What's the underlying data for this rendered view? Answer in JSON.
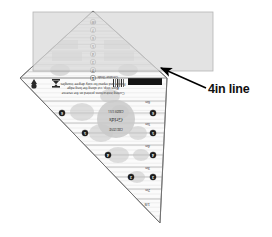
{
  "scene": {
    "title": "Quilting triangle ruler with 4in line annotation",
    "background_color": "#ffffff"
  },
  "annotation": {
    "label": "4in line",
    "label_color": "#101010",
    "arrow_color": "#000000",
    "arrow_from_x": 206,
    "arrow_from_y": 88,
    "arrow_to_x": 161,
    "arrow_to_y": 68
  },
  "overlay": {
    "name": "grey-highlight-rectangle",
    "fill": "#d9d9d9",
    "stroke": "#9a9a9a",
    "opacity": 0.72,
    "x": 33,
    "y": 12,
    "width": 180,
    "height": 59
  },
  "ruler": {
    "name": "60-degree-triangle-ruler",
    "body_fill": "#fbfbfb",
    "edge_color": "#6f6f6f",
    "apex_x": 93,
    "apex_y": 11,
    "left_x": 20,
    "left_y": 78,
    "right_x": 167,
    "right_y": 78,
    "bottom_x": 160,
    "bottom_y": 223,
    "grid_line_color": "#9d9d9d",
    "fine_line_color": "#c2c2c2",
    "top_angle_label": "60°",
    "center_markers": [
      {
        "label": "8",
        "y": 22
      },
      {
        "label": "7",
        "y": 30
      },
      {
        "label": "6",
        "y": 38
      },
      {
        "label": "5",
        "y": 46
      },
      {
        "label": "4",
        "y": 54
      },
      {
        "label": "3",
        "y": 62
      },
      {
        "label": "2",
        "y": 70
      },
      {
        "label": "1",
        "y": 78
      }
    ],
    "side_markers": [
      {
        "label": "6",
        "x": 62,
        "y": 113
      },
      {
        "label": "5",
        "x": 85,
        "y": 133
      },
      {
        "label": "4",
        "x": 108,
        "y": 155
      },
      {
        "label": "3",
        "x": 131,
        "y": 177
      }
    ],
    "right_markers": [
      {
        "label": "6",
        "x": 153,
        "y": 113
      },
      {
        "label": "5",
        "x": 153,
        "y": 133
      },
      {
        "label": "4",
        "x": 153,
        "y": 155
      },
      {
        "label": "3",
        "x": 153,
        "y": 177
      }
    ],
    "edge_scale_labels": [
      {
        "text": "6in",
        "x": 150,
        "y": 101
      },
      {
        "text": "5in",
        "x": 150,
        "y": 123
      },
      {
        "text": "4in",
        "x": 150,
        "y": 145
      },
      {
        "text": "3in",
        "x": 150,
        "y": 167
      },
      {
        "text": "2in",
        "x": 150,
        "y": 189
      }
    ],
    "bottom_tip_label": "1/8",
    "horizontal_lines_y": [
      101,
      113,
      123,
      133,
      145,
      155,
      167,
      177,
      189,
      199
    ],
    "logo": {
      "name": "maker-logo-badge",
      "center_x": 116,
      "center_y": 119,
      "radius": 19,
      "fill": "#c9c9c9",
      "top_text": "CREATIVE",
      "script_text": "Grids",
      "sub_text": "GRIDS USA"
    },
    "instruction_lines": [
      "Cutting instructions printed on the reverse",
      "Align strip, cut along the long edge",
      "Rotate and repeat for sixty degree triangles"
    ],
    "black_band": {
      "x": 128,
      "y": 78,
      "width": 34,
      "height": 7,
      "fill": "#141414"
    },
    "corner_tag_text": "Creative Grids",
    "small_icon_names": [
      "triangle-icon",
      "hourglass-icon",
      "barcode-icon"
    ]
  }
}
